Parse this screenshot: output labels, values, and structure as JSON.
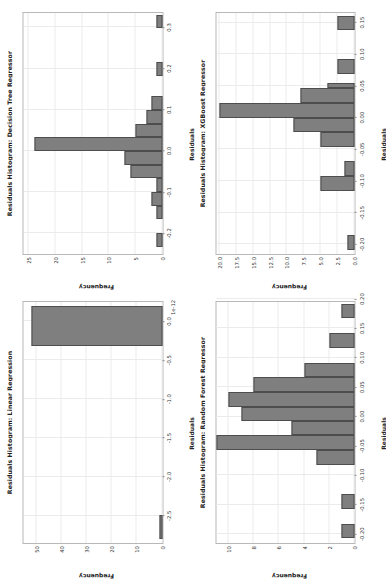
{
  "figure": {
    "background": "#ffffff",
    "bar_fill": "#7f7f7f",
    "bar_edge": "#4d4d4d",
    "grid_color": "#ebebeb",
    "rotation": "-90deg"
  },
  "chart_data": [
    {
      "id": "linear-regression",
      "type": "bar",
      "title": "Residuals Histogram: Linear Regression",
      "xlabel": "Residuals",
      "ylabel": "Frequency",
      "grid": true,
      "legend": "none",
      "x_offset_text": "1e-12",
      "xlim": [
        -2.85,
        0.25
      ],
      "ylim": [
        0,
        55
      ],
      "xticks": [
        "-2.5",
        "-2.0",
        "-1.5",
        "-1.0",
        "-0.5",
        "0.0"
      ],
      "xtick_values": [
        -2.5,
        -2.0,
        -1.5,
        -1.0,
        -0.5,
        0.0
      ],
      "yticks": [
        "0",
        "10",
        "20",
        "30",
        "40",
        "50"
      ],
      "ytick_values": [
        0,
        10,
        20,
        30,
        40,
        50
      ],
      "bin_edges": [
        -2.8,
        -2.49,
        -2.18,
        -1.87,
        -1.56,
        -1.25,
        -0.94,
        -0.63,
        -0.32,
        -0.01,
        0.2
      ],
      "bars": [
        {
          "x0": -2.8,
          "x1": -2.49,
          "height": 1
        },
        {
          "x0": -0.32,
          "x1": 0.2,
          "height": 52
        }
      ]
    },
    {
      "id": "decision-tree",
      "type": "bar",
      "title": "Residuals Histogram: Decision Tree Regressor",
      "xlabel": "Residuals",
      "ylabel": "Frequency",
      "grid": true,
      "legend": "none",
      "xlim": [
        -0.25,
        0.335
      ],
      "ylim": [
        0,
        26
      ],
      "xticks": [
        "-0.2",
        "-0.1",
        "0.0",
        "0.1",
        "0.2",
        "0.3"
      ],
      "xtick_values": [
        -0.2,
        -0.1,
        0.0,
        0.1,
        0.2,
        0.3
      ],
      "yticks": [
        "0",
        "5",
        "10",
        "15",
        "20",
        "25"
      ],
      "ytick_values": [
        0,
        5,
        10,
        15,
        20,
        25
      ],
      "bars": [
        {
          "x0": -0.232,
          "x1": -0.199,
          "height": 1
        },
        {
          "x0": -0.166,
          "x1": -0.133,
          "height": 1
        },
        {
          "x0": -0.133,
          "x1": -0.1,
          "height": 2
        },
        {
          "x0": -0.1,
          "x1": -0.066,
          "height": 1
        },
        {
          "x0": -0.066,
          "x1": -0.033,
          "height": 6
        },
        {
          "x0": -0.033,
          "x1": 0.0,
          "height": 7
        },
        {
          "x0": 0.0,
          "x1": 0.033,
          "height": 24
        },
        {
          "x0": 0.033,
          "x1": 0.066,
          "height": 5
        },
        {
          "x0": 0.066,
          "x1": 0.1,
          "height": 3
        },
        {
          "x0": 0.1,
          "x1": 0.133,
          "height": 2
        },
        {
          "x0": 0.182,
          "x1": 0.215,
          "height": 1
        },
        {
          "x0": 0.298,
          "x1": 0.331,
          "height": 1
        }
      ]
    },
    {
      "id": "random-forest",
      "type": "bar",
      "title": "Residuals Histogram: Random Forest Regressor",
      "xlabel": "Residuals",
      "ylabel": "Frequency",
      "grid": true,
      "legend": "none",
      "xlim": [
        -0.215,
        0.195
      ],
      "ylim": [
        0,
        11
      ],
      "xticks": [
        "-0.20",
        "-0.15",
        "-0.10",
        "-0.05",
        "0.00",
        "0.05",
        "0.10",
        "0.15",
        "0.20"
      ],
      "xtick_values": [
        -0.2,
        -0.15,
        -0.1,
        -0.05,
        0.0,
        0.05,
        0.1,
        0.15,
        0.2
      ],
      "yticks": [
        "0",
        "2",
        "4",
        "6",
        "8",
        "10"
      ],
      "ytick_values": [
        0,
        2,
        4,
        6,
        8,
        10
      ],
      "bars": [
        {
          "x0": -0.207,
          "x1": -0.182,
          "height": 1
        },
        {
          "x0": -0.157,
          "x1": -0.132,
          "height": 1
        },
        {
          "x0": -0.082,
          "x1": -0.057,
          "height": 3
        },
        {
          "x0": -0.057,
          "x1": -0.032,
          "height": 11
        },
        {
          "x0": -0.032,
          "x1": -0.008,
          "height": 5
        },
        {
          "x0": -0.008,
          "x1": 0.017,
          "height": 9
        },
        {
          "x0": 0.017,
          "x1": 0.042,
          "height": 10
        },
        {
          "x0": 0.042,
          "x1": 0.067,
          "height": 8
        },
        {
          "x0": 0.067,
          "x1": 0.092,
          "height": 4
        },
        {
          "x0": 0.117,
          "x1": 0.142,
          "height": 2
        },
        {
          "x0": 0.167,
          "x1": 0.192,
          "height": 1
        }
      ]
    },
    {
      "id": "xgboost",
      "type": "bar",
      "title": "Residuals Histogram: XGBoost Regressor",
      "xlabel": "Residuals",
      "ylabel": "Frequency",
      "grid": true,
      "legend": "none",
      "xlim": [
        -0.215,
        0.165
      ],
      "ylim": [
        0,
        20.5
      ],
      "xticks": [
        "-0.20",
        "-0.15",
        "-0.10",
        "-0.05",
        "0.00",
        "0.05",
        "0.10",
        "0.15"
      ],
      "xtick_values": [
        -0.2,
        -0.15,
        -0.1,
        -0.05,
        0.0,
        0.05,
        0.1,
        0.15
      ],
      "yticks": [
        "0.0",
        "2.5",
        "5.0",
        "7.5",
        "10.0",
        "12.5",
        "15.0",
        "17.5",
        "20.0"
      ],
      "ytick_values": [
        0.0,
        2.5,
        5.0,
        7.5,
        10.0,
        12.5,
        15.0,
        17.5,
        20.0
      ],
      "bars": [
        {
          "x0": -0.208,
          "x1": -0.185,
          "height": 1
        },
        {
          "x0": -0.115,
          "x1": -0.092,
          "height": 5
        },
        {
          "x0": -0.092,
          "x1": -0.069,
          "height": 1.5
        },
        {
          "x0": -0.046,
          "x1": -0.023,
          "height": 5
        },
        {
          "x0": -0.023,
          "x1": 0.0,
          "height": 9
        },
        {
          "x0": 0.0,
          "x1": 0.023,
          "height": 20
        },
        {
          "x0": 0.023,
          "x1": 0.046,
          "height": 8
        },
        {
          "x0": 0.046,
          "x1": 0.055,
          "height": 4
        },
        {
          "x0": 0.069,
          "x1": 0.092,
          "height": 2.5
        },
        {
          "x0": 0.138,
          "x1": 0.161,
          "height": 2.5
        }
      ]
    }
  ]
}
